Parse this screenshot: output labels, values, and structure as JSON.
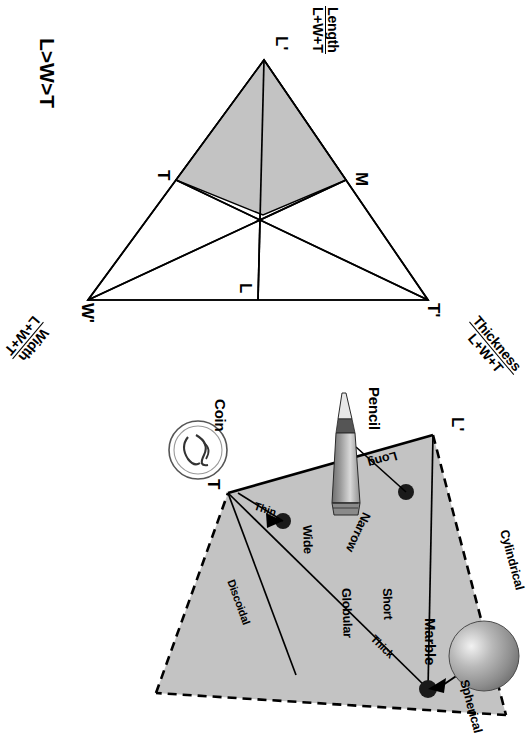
{
  "figure": {
    "domain": "scientific-diagram",
    "colors": {
      "ink": "#000000",
      "fill_shaded": "#c8c8c8",
      "paper": "#ffffff"
    }
  },
  "ternary_panel": {
    "title": "L>W>T",
    "vertices": [
      {
        "key": "L",
        "label": "L'",
        "axis_name": "Length",
        "axis_denominator": "L+W+T"
      },
      {
        "key": "W",
        "label": "W'",
        "axis_name": "Width",
        "axis_denominator": "L+W+T"
      },
      {
        "key": "T",
        "label": "T'",
        "axis_name": "Thickness",
        "axis_denominator": "L+W+T"
      }
    ],
    "midpoints": [
      {
        "key": "M_top",
        "label": "M"
      },
      {
        "key": "T_left",
        "label": "T"
      },
      {
        "key": "L_right",
        "label": "L"
      }
    ]
  },
  "shape_panel": {
    "zones": [
      {
        "id": "cylindrical",
        "label": "Cylindrical"
      },
      {
        "id": "spherical",
        "label": "Spherical"
      },
      {
        "id": "discoidal",
        "label": "Discoidal"
      },
      {
        "id": "long",
        "label": "Long"
      },
      {
        "id": "narrow",
        "label": "Narrow"
      },
      {
        "id": "short",
        "label": "Short"
      },
      {
        "id": "globular",
        "label": "Globular"
      },
      {
        "id": "thick",
        "label": "Thick"
      },
      {
        "id": "wide",
        "label": "Wide"
      },
      {
        "id": "thin",
        "label": "Thin"
      }
    ],
    "vertex_labels": [
      {
        "id": "vertex-L",
        "label": "L'"
      },
      {
        "id": "vertex-T",
        "label": "T"
      }
    ],
    "callouts": [
      {
        "id": "pencil",
        "label": "Pencil",
        "icon": "pencil-icon"
      },
      {
        "id": "marble",
        "label": "Marble",
        "icon": "sphere-icon"
      },
      {
        "id": "coin",
        "label": "Coin",
        "icon": "coin-icon"
      }
    ]
  }
}
